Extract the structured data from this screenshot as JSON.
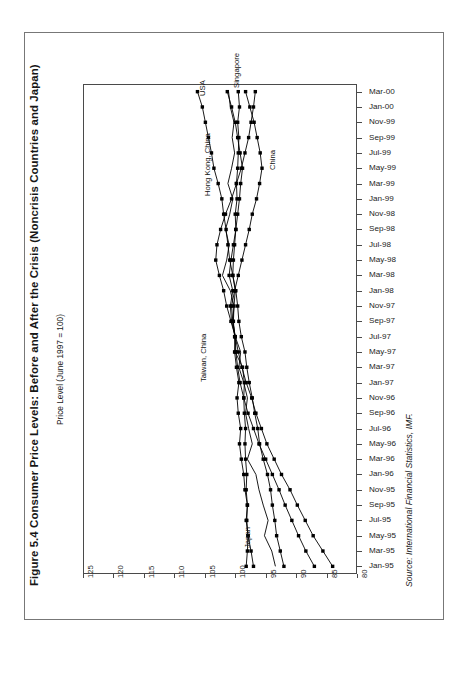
{
  "figure": {
    "title": "Figure 5.4 Consumer Price Levels: Before and After the Crisis (Noncrisis Countries and Japan)",
    "axis_label": "Price Level (June 1997 = 100)",
    "source": "Source: International Financial Statistics, IMF.",
    "orientation": "rotated-90-ccw"
  },
  "chart_data": {
    "type": "line",
    "title": "Figure 5.4 Consumer Price Levels: Before and After the Crisis (Noncrisis Countries and Japan)",
    "xlabel": "",
    "ylabel": "Price Level (June 1997 = 100)",
    "ylim": [
      80,
      125
    ],
    "grid": false,
    "legend": "inline-annotations",
    "value_ticks": [
      "125",
      "120",
      "115",
      "110",
      "105",
      "100",
      "95",
      "90",
      "85",
      "80"
    ],
    "categories": [
      "Jan-95",
      "Mar-95",
      "May-95",
      "Jul-95",
      "Sep-95",
      "Nov-95",
      "Jan-96",
      "Mar-96",
      "May-96",
      "Jul-96",
      "Sep-96",
      "Nov-96",
      "Jan-97",
      "Mar-97",
      "May-97",
      "Jul-97",
      "Sep-97",
      "Nov-97",
      "Jan-98",
      "Mar-98",
      "May-98",
      "Jul-98",
      "Sep-98",
      "Nov-98",
      "Jan-99",
      "Mar-99",
      "May-99",
      "Jul-99",
      "Sep-99",
      "Nov-99",
      "Jan-00",
      "Mar-00"
    ],
    "series": [
      {
        "name": "USA",
        "color": "#000000",
        "marker": "square",
        "values": [
          92.0,
          92.6,
          93.2,
          93.5,
          93.9,
          94.2,
          94.7,
          95.4,
          96.0,
          96.3,
          96.8,
          97.2,
          97.7,
          98.1,
          98.4,
          99.0,
          99.4,
          99.6,
          99.9,
          100.4,
          100.9,
          101.2,
          101.5,
          101.9,
          102.2,
          102.8,
          103.5,
          103.9,
          104.4,
          104.9,
          105.4,
          106.2
        ]
      },
      {
        "name": "Singapore",
        "color": "#000000",
        "marker": "square",
        "values": [
          97.0,
          97.4,
          97.9,
          98.2,
          98.0,
          98.4,
          98.6,
          99.0,
          99.3,
          99.1,
          99.5,
          99.7,
          99.4,
          99.8,
          100.1,
          100.0,
          100.6,
          100.8,
          100.4,
          101.0,
          100.7,
          100.3,
          99.9,
          99.6,
          99.3,
          99.1,
          98.8,
          99.2,
          99.6,
          100.0,
          100.6,
          101.3
        ]
      },
      {
        "name": "China",
        "color": "#000000",
        "marker": "square",
        "values": [
          84.0,
          85.6,
          87.2,
          88.5,
          89.8,
          91.0,
          92.4,
          93.6,
          94.8,
          95.7,
          96.6,
          97.3,
          98.2,
          98.9,
          99.5,
          100.0,
          100.4,
          100.6,
          100.1,
          99.5,
          98.9,
          98.3,
          97.7,
          97.2,
          96.5,
          96.0,
          95.6,
          95.9,
          96.4,
          96.9,
          97.6,
          98.3
        ]
      },
      {
        "name": "Hong Kong, China",
        "color": "#000000",
        "marker": "square",
        "values": [
          87.0,
          88.4,
          89.6,
          90.7,
          91.8,
          92.8,
          93.9,
          95.0,
          96.1,
          97.0,
          97.9,
          98.6,
          99.2,
          99.6,
          99.9,
          100.0,
          100.7,
          101.4,
          101.9,
          102.6,
          103.2,
          103.0,
          102.4,
          101.6,
          100.6,
          99.8,
          99.0,
          98.4,
          97.8,
          97.4,
          97.0,
          96.7
        ]
      },
      {
        "name": "Taiwan, China",
        "color": "#000000",
        "marker": "none",
        "values": [
          93.4,
          94.0,
          95.2,
          94.6,
          95.4,
          96.1,
          96.6,
          98.0,
          97.2,
          97.8,
          98.3,
          98.0,
          98.6,
          99.4,
          99.1,
          100.0,
          100.4,
          100.2,
          100.8,
          102.1,
          101.4,
          101.0,
          101.6,
          100.9,
          100.4,
          101.2,
          100.6,
          100.1,
          100.5,
          100.2,
          100.8,
          101.1
        ]
      },
      {
        "name": "Japan",
        "color": "#000000",
        "marker": "square",
        "values": [
          98.2,
          98.0,
          97.9,
          98.1,
          98.0,
          98.2,
          98.1,
          98.3,
          98.4,
          98.3,
          98.5,
          98.6,
          98.5,
          98.8,
          100.0,
          100.1,
          100.3,
          100.2,
          100.0,
          100.4,
          100.3,
          100.1,
          99.9,
          100.0,
          99.7,
          99.8,
          99.6,
          99.5,
          99.4,
          99.6,
          99.3,
          99.5
        ]
      }
    ],
    "annotations": [
      {
        "label": "USA",
        "x": 198,
        "y": 96
      },
      {
        "label": "Singapore",
        "x": 232,
        "y": 88
      },
      {
        "label": "China",
        "x": 268,
        "y": 170
      },
      {
        "label": "Hong Kong, China",
        "x": 203,
        "y": 196
      },
      {
        "label": "Taiwan, China",
        "x": 199,
        "y": 382
      },
      {
        "label": "Japan",
        "x": 243,
        "y": 548
      }
    ]
  }
}
